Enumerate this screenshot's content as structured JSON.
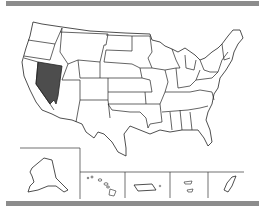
{
  "map": {
    "subject": "United States",
    "highlighted_state": "Nevada",
    "insets": [
      "Alaska",
      "Hawaii",
      "Puerto Rico",
      "U.S. Virgin Islands",
      "Guam"
    ]
  },
  "colors": {
    "bar": "#8c8c8c",
    "highlight": "#4d4d4d",
    "state_fill": "#ffffff",
    "border": "#222222",
    "background": "#ffffff"
  }
}
